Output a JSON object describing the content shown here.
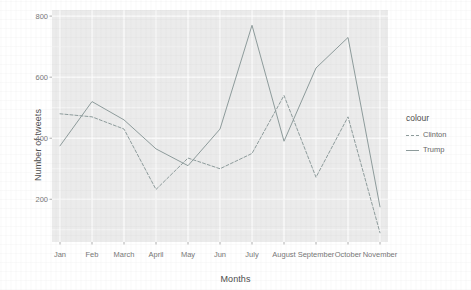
{
  "chart_data": {
    "type": "line",
    "title": "",
    "xlabel": "Months",
    "ylabel": "Number of tweets",
    "categories": [
      "Jan",
      "Feb",
      "March",
      "April",
      "May",
      "Jun",
      "July",
      "August",
      "September",
      "October",
      "November"
    ],
    "series": [
      {
        "name": "Clinton",
        "style": "dashed",
        "color": "#8d9b9b",
        "values": [
          480,
          470,
          430,
          232,
          335,
          300,
          350,
          540,
          272,
          470,
          90
        ]
      },
      {
        "name": "Trump",
        "style": "solid",
        "color": "#8d9b9b",
        "values": [
          375,
          520,
          460,
          365,
          310,
          430,
          770,
          390,
          630,
          730,
          175
        ]
      }
    ],
    "ylim": [
      60,
      820
    ],
    "yticks": [
      200,
      400,
      600,
      800
    ],
    "ytick_labels": [
      "200",
      "400",
      "600",
      "800"
    ],
    "grid": true,
    "grid_color": "#ffffff",
    "panel_background": "#ebebeb",
    "legend_position": "right",
    "legend_title": "colour"
  },
  "axes": {
    "y_title": "Number of tweets",
    "x_title": "Months"
  },
  "legend": {
    "title": "colour",
    "entries": [
      {
        "label": "Clinton"
      },
      {
        "label": "Trump"
      }
    ]
  }
}
